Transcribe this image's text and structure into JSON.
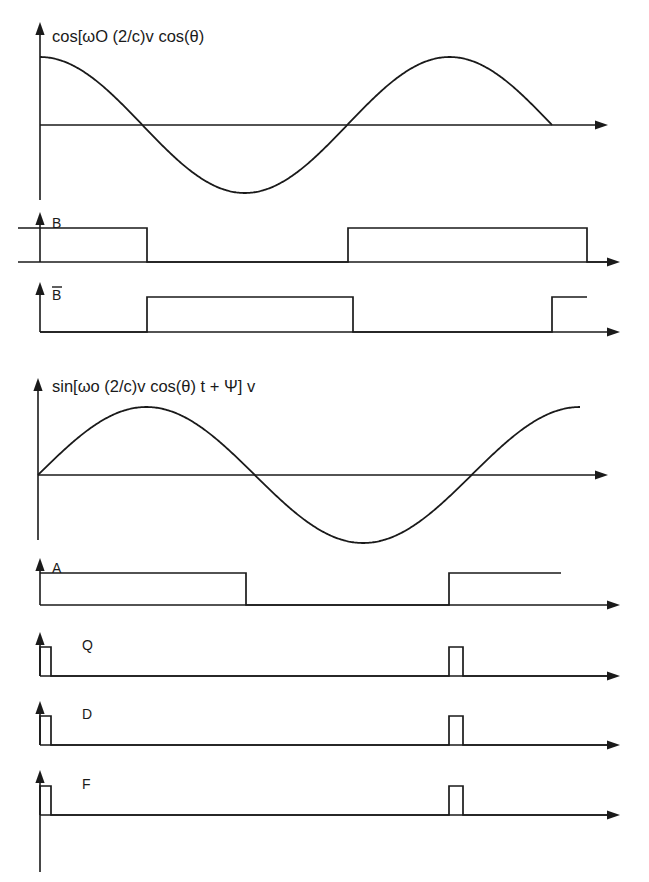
{
  "figure": {
    "background_color": "#ffffff",
    "line_color": "#1a1a1a"
  },
  "chart_data": {
    "type": "line",
    "title": "",
    "xlabel": "",
    "ylabel": "",
    "grid": false,
    "legend": false,
    "traces": [
      {
        "id": "cos-carrier",
        "label": "cos[ωO (2/c)v cos(θ)",
        "kind": "analog",
        "waveform": "cosine",
        "axis_y": 125,
        "x_start": 40,
        "x_end": 552,
        "amplitude": 68,
        "cycles": 1.25,
        "phase_deg": 0,
        "axis_arrow_x": 608,
        "axis_top_y": 22,
        "axis_bottom_y": 200,
        "label_x": 52,
        "label_y": 42,
        "key_points": [
          {
            "x": 40,
            "y": "max"
          },
          {
            "x": 148,
            "y": "zero-falling"
          },
          {
            "x": 205,
            "y": "min"
          },
          {
            "x": 283,
            "y": "zero-rising"
          },
          {
            "x": 365,
            "y": "max"
          },
          {
            "x": 552,
            "y": "zero-falling"
          }
        ]
      },
      {
        "id": "sin-carrier",
        "label": "sin[ωo (2/c)v cos(θ) t + Ψ] v",
        "kind": "analog",
        "waveform": "sine",
        "axis_y": 475,
        "x_start": 38,
        "x_end": 580,
        "amplitude": 68,
        "cycles": 1.25,
        "phase_deg": 0,
        "axis_arrow_x": 608,
        "axis_top_y": 378,
        "axis_bottom_y": 540,
        "label_x": 52,
        "label_y": 392,
        "key_points": [
          {
            "x": 38,
            "y": "zero-rising"
          },
          {
            "x": 120,
            "y": "max"
          },
          {
            "x": 200,
            "y": "zero-falling"
          },
          {
            "x": 285,
            "y": "min"
          },
          {
            "x": 368,
            "y": "zero-rising"
          },
          {
            "x": 580,
            "y": "max"
          }
        ]
      },
      {
        "id": "signal-B",
        "label": "B",
        "kind": "digital",
        "axis_y": 262,
        "axis_top_y": 212,
        "high_y": 228,
        "axis_arrow_x": 620,
        "label_x": 52,
        "label_y": 228,
        "label_overbar": false,
        "trace_start_x": 18,
        "initial_level": "high",
        "transitions": [
          {
            "x": 147,
            "to": "low"
          },
          {
            "x": 348,
            "to": "high"
          },
          {
            "x": 587,
            "to": "low"
          }
        ],
        "trace_end_x": 610
      },
      {
        "id": "signal-B-bar",
        "label": "B",
        "kind": "digital",
        "axis_y": 332,
        "axis_top_y": 282,
        "high_y": 297,
        "axis_arrow_x": 620,
        "label_x": 52,
        "label_y": 300,
        "label_overbar": true,
        "trace_start_x": 40,
        "initial_level": "low",
        "transitions": [
          {
            "x": 147,
            "to": "high"
          },
          {
            "x": 353,
            "to": "low"
          },
          {
            "x": 552,
            "to": "high"
          }
        ],
        "open_end_x": 587,
        "trace_end_x": 610
      },
      {
        "id": "signal-A",
        "label": "A",
        "kind": "digital",
        "axis_y": 605,
        "axis_top_y": 558,
        "high_y": 573,
        "axis_arrow_x": 620,
        "label_x": 52,
        "label_y": 573,
        "label_overbar": false,
        "trace_start_x": 40,
        "initial_level": "high",
        "transitions": [
          {
            "x": 246,
            "to": "low"
          },
          {
            "x": 449,
            "to": "high"
          }
        ],
        "open_end_x": 561,
        "trace_end_x": 610
      },
      {
        "id": "signal-Q",
        "label": "Q",
        "kind": "pulse",
        "axis_y": 676,
        "axis_top_y": 632,
        "high_y": 647,
        "axis_arrow_x": 620,
        "label_x": 82,
        "label_y": 650,
        "pulses": [
          {
            "start": 40,
            "end": 51
          },
          {
            "start": 449,
            "end": 463
          }
        ],
        "trace_end_x": 610
      },
      {
        "id": "signal-D",
        "label": "D",
        "kind": "pulse",
        "axis_y": 745,
        "axis_top_y": 701,
        "high_y": 716,
        "axis_arrow_x": 620,
        "label_x": 82,
        "label_y": 719,
        "pulses": [
          {
            "start": 40,
            "end": 51
          },
          {
            "start": 449,
            "end": 463
          }
        ],
        "trace_end_x": 610
      },
      {
        "id": "signal-F",
        "label": "F",
        "kind": "pulse",
        "axis_y": 815,
        "axis_top_y": 770,
        "axis_bottom_y": 872,
        "high_y": 786,
        "axis_arrow_x": 620,
        "label_x": 82,
        "label_y": 789,
        "pulses": [
          {
            "start": 40,
            "end": 51
          },
          {
            "start": 449,
            "end": 463
          }
        ],
        "trace_end_x": 610
      }
    ]
  }
}
